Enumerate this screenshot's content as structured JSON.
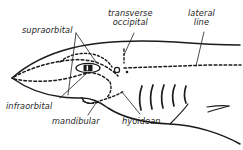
{
  "figure": {
    "background_color": "#ffffff",
    "ink_color": "#1a1a1a",
    "width": 243,
    "height": 150
  },
  "labels": [
    {
      "id": "supraorbital",
      "text": "supraorbital",
      "x": 22,
      "y": 26
    },
    {
      "id": "transverse-occipital",
      "text": "transverse\noccipital",
      "x": 110,
      "y": 10
    },
    {
      "id": "lateral-line",
      "text": "lateral\nline",
      "x": 190,
      "y": 10
    },
    {
      "id": "infraorbital",
      "text": "infraorbital",
      "x": 6,
      "y": 103
    },
    {
      "id": "mandibular",
      "text": "mandibular",
      "x": 52,
      "y": 118
    },
    {
      "id": "hyoidean",
      "text": "hyoidean",
      "x": 122,
      "y": 118
    }
  ],
  "anatomy": {
    "gill_slits": 5,
    "eye": "lateral eye with dark pupil",
    "spiracle": "small circle behind eye",
    "pore": "dot behind spiracle",
    "canals": [
      "supraorbital",
      "infraorbital",
      "transverse occipital",
      "mandibular",
      "hyoidean",
      "lateral line"
    ]
  }
}
